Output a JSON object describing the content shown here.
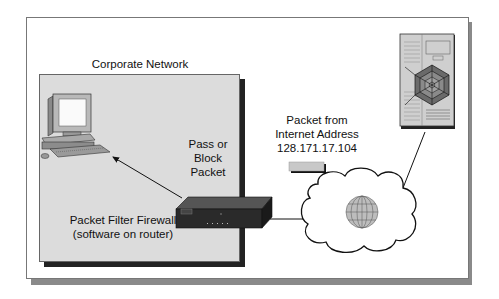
{
  "diagram": {
    "corporate_network_label": "Corporate Network",
    "pass_block_label": [
      "Pass or",
      "Block",
      "Packet"
    ],
    "firewall_label": [
      "Packet Filter Firewall",
      "(software on router)"
    ],
    "packet_label": [
      "Packet from",
      "Internet Address",
      "128.171.17.104"
    ],
    "nodes": [
      {
        "id": "client-pc",
        "icon": "desktop-computer-icon"
      },
      {
        "id": "router",
        "icon": "router-icon"
      },
      {
        "id": "internet",
        "icon": "cloud-globe-icon"
      },
      {
        "id": "web-server",
        "icon": "server-web-icon"
      },
      {
        "id": "packet",
        "icon": "packet-icon"
      }
    ],
    "edges": [
      {
        "from": "router",
        "to": "client-pc",
        "type": "arrow"
      },
      {
        "from": "router",
        "to": "internet",
        "type": "line"
      },
      {
        "from": "internet",
        "to": "web-server",
        "type": "line"
      }
    ],
    "colors": {
      "network_fill": "#dcdcdc",
      "shadow_dark": "#222222",
      "frame_shadow": "#8a8a8a",
      "router": "#2a2a2a",
      "packet": "#c8c8c8"
    }
  }
}
